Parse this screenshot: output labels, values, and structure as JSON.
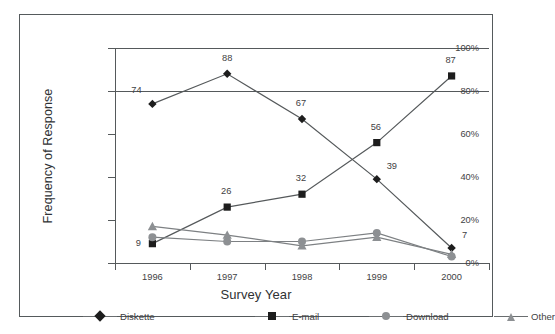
{
  "chart_data": {
    "type": "line",
    "title": "",
    "xlabel": "Survey Year",
    "ylabel": "Frequency of Response",
    "categories": [
      "1996",
      "1997",
      "1998",
      "1999",
      "2000"
    ],
    "ylim": [
      0,
      100
    ],
    "ytick_labels": [
      "0%",
      "20%",
      "40%",
      "60%",
      "80%",
      "100%"
    ],
    "ytick_values": [
      0,
      20,
      40,
      60,
      80,
      100
    ],
    "grid": "horizontal-lines-at-80-and-100",
    "legend_position": "bottom",
    "series": [
      {
        "name": "Diskette",
        "marker": "diamond",
        "color": "#1d1d1d",
        "values": [
          74,
          88,
          67,
          39,
          7
        ],
        "labels": [
          "74",
          "88",
          "67",
          "39",
          "7"
        ],
        "labels_shown": true
      },
      {
        "name": "E-mail",
        "marker": "square",
        "color": "#1d1d1d",
        "values": [
          9,
          26,
          32,
          56,
          87
        ],
        "labels": [
          "9",
          "26",
          "32",
          "56",
          "87"
        ],
        "labels_shown": true
      },
      {
        "name": "Download",
        "marker": "circle",
        "color": "#8d9093",
        "values": [
          12,
          10,
          10,
          14,
          3
        ],
        "labels": [
          "",
          "",
          "",
          "",
          ""
        ],
        "labels_shown": false
      },
      {
        "name": "Other",
        "marker": "triangle",
        "color": "#8d9093",
        "values": [
          17,
          13,
          8,
          12,
          4
        ],
        "labels": [
          "",
          "",
          "",
          "",
          ""
        ],
        "labels_shown": false
      }
    ]
  },
  "legend": {
    "items": [
      {
        "label": "Diskette",
        "marker": "diamond"
      },
      {
        "label": "E-mail",
        "marker": "square"
      },
      {
        "label": "Download",
        "marker": "circle"
      },
      {
        "label": "Other",
        "marker": "triangle"
      }
    ]
  },
  "label_offsets": {
    "Diskette": [
      {
        "dx": -16,
        "dy": -9
      },
      {
        "dx": 0,
        "dy": -11
      },
      {
        "dx": -1,
        "dy": -11
      },
      {
        "dx": 15,
        "dy": -8
      },
      {
        "dx": 13,
        "dy": -8
      }
    ],
    "E-mail": [
      {
        "dx": -14,
        "dy": 4
      },
      {
        "dx": -1,
        "dy": -11
      },
      {
        "dx": -1,
        "dy": -11
      },
      {
        "dx": -1,
        "dy": -11
      },
      {
        "dx": -1,
        "dy": -11
      }
    ]
  }
}
